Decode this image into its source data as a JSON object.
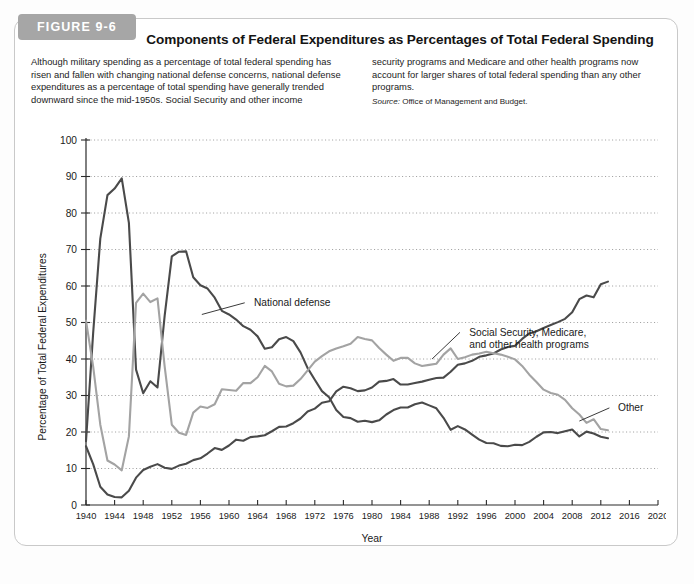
{
  "figure": {
    "tab_label": "FIGURE 9-6",
    "title": "Components of Federal Expenditures as Percentages of Total Federal Spending",
    "caption_left": "Although military spending as a percentage of total federal spending has risen and fallen with changing national defense concerns, national defense expenditures as a percentage of total spending have generally trended downward since the mid-1950s. Social Security and other income",
    "caption_right": "security programs and Medicare and other health programs now account for larger shares of total federal spending than any other programs.",
    "source_prefix": "Source:",
    "source_text": " Office of Management and Budget."
  },
  "chart_data": {
    "type": "line",
    "title": "Components of Federal Expenditures as Percentages of Total Federal Spending",
    "xlabel": "Year",
    "ylabel": "Percentage of Total Federal Expenditures",
    "xlim": [
      1940,
      2020
    ],
    "ylim": [
      0,
      100
    ],
    "ytick_step": 10,
    "xtick_step": 4,
    "grid": true,
    "legend_position": "inline-annotations",
    "yticks": [
      0,
      10,
      20,
      30,
      40,
      50,
      60,
      70,
      80,
      90,
      100
    ],
    "xticks": [
      1940,
      1944,
      1948,
      1952,
      1956,
      1960,
      1964,
      1968,
      1972,
      1976,
      1980,
      1984,
      1988,
      1992,
      1996,
      2000,
      2004,
      2008,
      2012,
      2016,
      2020
    ],
    "colors": {
      "national_defense": "#4a4a4a",
      "social_security_medicare": "#4a4a4a",
      "other": "#a3a3a3",
      "gridline": "#8d8d8d",
      "axis": "#2b2b2b"
    },
    "x": [
      1940,
      1941,
      1942,
      1943,
      1944,
      1945,
      1946,
      1947,
      1948,
      1949,
      1950,
      1951,
      1952,
      1953,
      1954,
      1955,
      1956,
      1957,
      1958,
      1959,
      1960,
      1961,
      1962,
      1963,
      1964,
      1965,
      1966,
      1967,
      1968,
      1969,
      1970,
      1971,
      1972,
      1973,
      1974,
      1975,
      1976,
      1977,
      1978,
      1979,
      1980,
      1981,
      1982,
      1983,
      1984,
      1985,
      1986,
      1987,
      1988,
      1989,
      1990,
      1991,
      1992,
      1993,
      1994,
      1995,
      1996,
      1997,
      1998,
      1999,
      2000,
      2001,
      2002,
      2003,
      2004,
      2005,
      2006,
      2007,
      2008,
      2009,
      2010,
      2011,
      2012,
      2013
    ],
    "series": [
      {
        "name": "National defense",
        "label": "National defense",
        "color": "#4a4a4a",
        "values": [
          17.5,
          47.1,
          73.0,
          84.9,
          86.7,
          89.5,
          77.3,
          37.1,
          30.6,
          33.9,
          32.2,
          51.8,
          68.1,
          69.4,
          69.5,
          62.4,
          60.2,
          59.3,
          56.8,
          53.2,
          52.2,
          50.8,
          49.0,
          48.0,
          46.2,
          42.8,
          43.2,
          45.4,
          46.0,
          44.9,
          41.8,
          37.5,
          34.3,
          31.2,
          29.5,
          26.0,
          24.1,
          23.8,
          22.8,
          23.1,
          22.7,
          23.2,
          24.8,
          26.0,
          26.7,
          26.7,
          27.6,
          28.1,
          27.3,
          26.5,
          23.9,
          20.6,
          21.6,
          20.7,
          19.3,
          17.9,
          17.0,
          16.9,
          16.2,
          16.1,
          16.5,
          16.4,
          17.3,
          18.7,
          19.9,
          20.0,
          19.7,
          20.2,
          20.7,
          18.8,
          20.1,
          19.6,
          18.7,
          18.3
        ]
      },
      {
        "name": "Social Security, Medicare, and other health programs",
        "label_line1": "Social Security, Medicare,",
        "label_line2": "and other health programs",
        "color": "#4a4a4a",
        "values": [
          16.1,
          11.2,
          5.0,
          2.9,
          2.2,
          2.1,
          3.9,
          7.5,
          9.6,
          10.5,
          11.2,
          10.2,
          9.9,
          10.8,
          11.3,
          12.3,
          12.8,
          14.1,
          15.6,
          15.1,
          16.3,
          17.9,
          17.6,
          18.6,
          18.8,
          19.1,
          20.2,
          21.4,
          21.5,
          22.4,
          23.7,
          25.6,
          26.4,
          28.0,
          28.4,
          31.1,
          32.4,
          32.0,
          31.2,
          31.4,
          32.2,
          33.8,
          34.0,
          34.5,
          33.0,
          33.0,
          33.4,
          33.8,
          34.3,
          34.8,
          34.9,
          36.5,
          38.4,
          38.8,
          39.5,
          40.6,
          41.0,
          41.5,
          42.6,
          43.3,
          43.6,
          45.5,
          47.0,
          47.6,
          48.5,
          49.3,
          50.1,
          51.0,
          52.8,
          56.4,
          57.4,
          56.9,
          60.5,
          61.2
        ]
      },
      {
        "name": "Other",
        "label": "Other",
        "color": "#a3a3a3",
        "values": [
          50.5,
          38.0,
          22.0,
          12.2,
          11.1,
          9.5,
          18.8,
          55.4,
          57.9,
          55.6,
          56.6,
          38.0,
          22.0,
          19.8,
          19.2,
          25.3,
          27.0,
          26.6,
          27.6,
          31.7,
          31.5,
          31.3,
          33.4,
          33.4,
          35.0,
          38.1,
          36.6,
          33.2,
          32.5,
          32.7,
          34.5,
          36.9,
          39.3,
          40.8,
          42.1,
          42.9,
          43.5,
          44.2,
          46.0,
          45.5,
          45.1,
          43.0,
          41.2,
          39.5,
          40.3,
          40.3,
          38.8,
          38.1,
          38.4,
          38.7,
          41.2,
          42.9,
          40.0,
          40.5,
          41.2,
          41.5,
          42.0,
          41.6,
          41.2,
          40.6,
          39.9,
          38.1,
          35.7,
          33.7,
          31.6,
          30.7,
          30.2,
          28.8,
          26.5,
          24.8,
          22.5,
          23.5,
          20.8,
          20.5
        ]
      }
    ],
    "annotations": [
      {
        "text": "National defense",
        "x": 1966,
        "y": 55
      },
      {
        "text": "Social Security, Medicare, and other health programs",
        "x": 1993,
        "y": 46
      },
      {
        "text": "Other",
        "x": 2014,
        "y": 25
      }
    ]
  }
}
